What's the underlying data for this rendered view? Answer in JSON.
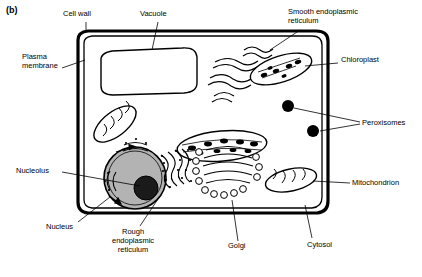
{
  "figure": {
    "panel_label": "(b)",
    "type": "plant-cell-diagram",
    "caption_items": []
  },
  "labels": [
    {
      "id": "cell-wall",
      "text": "Cell wall",
      "x": 63,
      "y": 13,
      "align": "left"
    },
    {
      "id": "vacuole",
      "text": "Vacuole",
      "x": 140,
      "y": 13,
      "align": "left"
    },
    {
      "id": "smooth-er",
      "text": "Smooth endoplasmic\nreticulum",
      "x": 288,
      "y": 11,
      "align": "left"
    },
    {
      "id": "plasma-membrane",
      "text": "Plasma\nmembrane",
      "x": 20,
      "y": 54,
      "align": "left"
    },
    {
      "id": "chloroplast",
      "text": "Chloroplast",
      "x": 340,
      "y": 57,
      "align": "left"
    },
    {
      "id": "peroxisomes",
      "text": "Peroxisomes",
      "x": 362,
      "y": 121,
      "align": "left"
    },
    {
      "id": "nucleolus",
      "text": "Nucleolus",
      "x": 16,
      "y": 167,
      "align": "left"
    },
    {
      "id": "mitochondrion",
      "text": "Mitochondrion",
      "x": 352,
      "y": 179,
      "align": "left"
    },
    {
      "id": "nucleus",
      "text": "Nucleus",
      "x": 46,
      "y": 224,
      "align": "left"
    },
    {
      "id": "rough-er",
      "text": "Rough\nendoplasmic\nreticulum",
      "x": 112,
      "y": 228,
      "align": "left"
    },
    {
      "id": "golgi",
      "text": "Golgi",
      "x": 228,
      "y": 243,
      "align": "left"
    },
    {
      "id": "cytosol",
      "text": "Cytosol",
      "x": 307,
      "y": 242,
      "align": "left"
    }
  ],
  "colors": {
    "outline": "#000000",
    "background": "#ffffff",
    "nucleus_fill": "#b3b3b3",
    "nucleolus_fill": "#1a1a1a",
    "organelle_fill": "#ffffff",
    "peroxisome_fill": "#000000"
  }
}
